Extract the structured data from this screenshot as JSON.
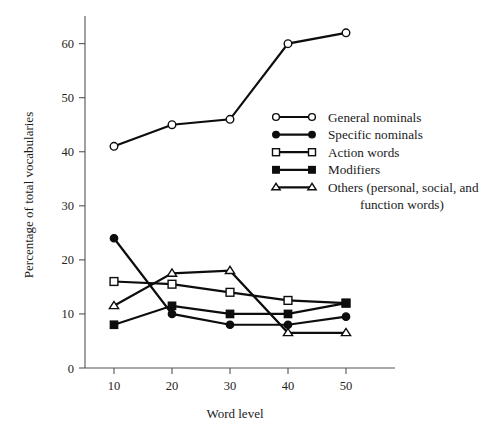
{
  "chart_data": {
    "type": "line",
    "title": "",
    "xlabel": "Word level",
    "ylabel": "Percentage of total vocabularies",
    "x": [
      10,
      20,
      30,
      40,
      50
    ],
    "xticklabels": [
      "10",
      "20",
      "30",
      "40",
      "50"
    ],
    "yticklabels": [
      "0",
      "10",
      "20",
      "30",
      "40",
      "50",
      "60"
    ],
    "yticks": [
      0,
      10,
      20,
      30,
      40,
      50,
      60
    ],
    "xlim": [
      5,
      55
    ],
    "ylim": [
      0,
      64
    ],
    "grid": false,
    "legend_position": "upper right",
    "series": [
      {
        "name": "General nominals",
        "marker": "open-circle",
        "values": [
          41,
          45,
          46,
          60,
          62
        ]
      },
      {
        "name": "Specific nominals",
        "marker": "filled-circle",
        "values": [
          24,
          10,
          8,
          8,
          9.5
        ]
      },
      {
        "name": "Action words",
        "marker": "open-square",
        "values": [
          16,
          15.5,
          14,
          12.5,
          12
        ]
      },
      {
        "name": "Modifiers",
        "marker": "filled-square",
        "values": [
          8,
          11.5,
          10,
          10,
          12
        ]
      },
      {
        "name": "Others (personal, social, and function words)",
        "marker": "open-triangle",
        "values": [
          11.5,
          17.5,
          18,
          6.5,
          6.5
        ]
      }
    ],
    "legend_entries": [
      {
        "label": "General nominals",
        "marker": "open-circle",
        "line2": ""
      },
      {
        "label": "Specific nominals",
        "marker": "filled-circle",
        "line2": ""
      },
      {
        "label": "Action words",
        "marker": "open-square",
        "line2": ""
      },
      {
        "label": "Modifiers",
        "marker": "filled-square",
        "line2": ""
      },
      {
        "label": "Others (personal, social, and",
        "marker": "open-triangle",
        "line2": "function words)"
      }
    ],
    "colors": {
      "line": "#0d0d0d",
      "axis": "#55544f",
      "background": "#ffffff",
      "marker_fill_open": "#ffffff"
    }
  }
}
